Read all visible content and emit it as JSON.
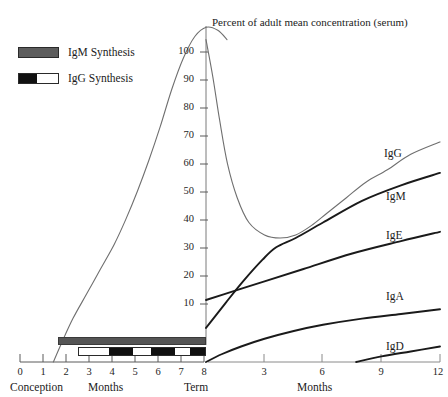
{
  "chart_data": {
    "type": "line",
    "title": "Percent of adult mean concentration (serum)",
    "ylabel": "",
    "ylim": [
      0,
      110
    ],
    "yticks": [
      10,
      20,
      30,
      40,
      50,
      60,
      70,
      80,
      90,
      100
    ],
    "grid": false,
    "legend_position": "top-left",
    "axes": [
      {
        "id": "fetal",
        "xlabel": "Months",
        "xlim": [
          0,
          9
        ],
        "xticks": [
          0,
          1,
          2,
          3,
          4,
          5,
          6,
          7,
          8
        ],
        "start_caption": "Conception",
        "end_caption": "Term"
      },
      {
        "id": "postnatal",
        "xlabel": "Months",
        "xlim": [
          0,
          12
        ],
        "xticks": [
          3,
          6,
          9,
          12
        ]
      }
    ],
    "series": [
      {
        "name": "IgG",
        "label": "IgG",
        "color": "#6f6f6f",
        "segments": [
          {
            "axis": "fetal",
            "points": [
              [
                1.45,
                0
              ],
              [
                1.8,
                6
              ],
              [
                2.3,
                14
              ],
              [
                2.9,
                22
              ],
              [
                3.5,
                30
              ],
              [
                4.1,
                38
              ],
              [
                4.6,
                46
              ],
              [
                5.1,
                55
              ],
              [
                5.6,
                65
              ],
              [
                6.1,
                76
              ],
              [
                6.6,
                88
              ],
              [
                7.1,
                98
              ],
              [
                7.6,
                105
              ],
              [
                8.1,
                108
              ],
              [
                8.6,
                107
              ],
              [
                9.0,
                104
              ]
            ]
          },
          {
            "axis": "postnatal",
            "points": [
              [
                0.0,
                104
              ],
              [
                0.35,
                92
              ],
              [
                0.7,
                78
              ],
              [
                1.1,
                64
              ],
              [
                1.6,
                53
              ],
              [
                2.2,
                45
              ],
              [
                3.0,
                41
              ],
              [
                3.8,
                40
              ],
              [
                4.6,
                41
              ],
              [
                5.4,
                44
              ],
              [
                6.2,
                48
              ],
              [
                7.2,
                53
              ],
              [
                8.2,
                58
              ],
              [
                9.3,
                62
              ],
              [
                10.5,
                67
              ],
              [
                12.0,
                71
              ]
            ]
          }
        ]
      },
      {
        "name": "IgM",
        "label": "IgM",
        "color": "#1a1a1a",
        "segments": [
          {
            "axis": "postnatal",
            "points": [
              [
                0.0,
                11
              ],
              [
                1.0,
                19
              ],
              [
                1.9,
                26
              ],
              [
                2.9,
                33
              ],
              [
                3.6,
                37
              ],
              [
                4.6,
                40
              ],
              [
                6.0,
                45
              ],
              [
                8.0,
                52
              ],
              [
                10.0,
                57
              ],
              [
                12.0,
                61
              ]
            ]
          }
        ]
      },
      {
        "name": "IgE",
        "label": "IgE",
        "color": "#1a1a1a",
        "segments": [
          {
            "axis": "postnatal",
            "points": [
              [
                0.0,
                20
              ],
              [
                1.5,
                23
              ],
              [
                3.0,
                26
              ],
              [
                5.0,
                30
              ],
              [
                7.5,
                35
              ],
              [
                10.0,
                39
              ],
              [
                12.0,
                42
              ]
            ]
          }
        ]
      },
      {
        "name": "IgA",
        "label": "IgA",
        "color": "#1a1a1a",
        "segments": [
          {
            "axis": "postnatal",
            "points": [
              [
                0.0,
                0
              ],
              [
                0.8,
                2.5
              ],
              [
                1.8,
                5
              ],
              [
                3.0,
                7.5
              ],
              [
                4.5,
                10
              ],
              [
                6.0,
                12
              ],
              [
                8.0,
                14
              ],
              [
                10.0,
                15.5
              ],
              [
                12.0,
                17
              ]
            ]
          }
        ]
      },
      {
        "name": "IgD",
        "label": "IgD",
        "color": "#1a1a1a",
        "segments": [
          {
            "axis": "postnatal",
            "points": [
              [
                7.7,
                0
              ],
              [
                9.0,
                1.8
              ],
              [
                10.5,
                3.4
              ],
              [
                12.0,
                5
              ]
            ]
          }
        ]
      }
    ],
    "synthesis_bars": [
      {
        "name": "IgM Synthesis",
        "style": "solid",
        "start_month": 1.9,
        "end_month": 9.0
      },
      {
        "name": "IgG Synthesis",
        "style": "intermittent",
        "start_month": 3.1,
        "end_month": 9.0
      }
    ]
  },
  "legend": {
    "items": [
      {
        "label": "IgM Synthesis",
        "swatch": "igm-solid-gray"
      },
      {
        "label": "IgG Synthesis",
        "swatch": "igg-black-white"
      }
    ]
  },
  "title": {
    "text": "Percent of adult mean concentration (serum)"
  },
  "y_axis": {
    "ticks": [
      "100",
      "90",
      "80",
      "70",
      "60",
      "50",
      "40",
      "30",
      "20",
      "10"
    ]
  },
  "x_axis_left": {
    "ticks": [
      "0",
      "1",
      "2",
      "3",
      "4",
      "5",
      "6",
      "7",
      "8"
    ],
    "caption_start": "Conception",
    "caption_center": "Months",
    "caption_end": "Term"
  },
  "x_axis_right": {
    "ticks": [
      "3",
      "6",
      "9",
      "12"
    ],
    "caption_center": "Months"
  },
  "curve_labels": {
    "igg": "IgG",
    "igm": "IgM",
    "ige": "IgE",
    "iga": "IgA",
    "igd": "IgD"
  }
}
